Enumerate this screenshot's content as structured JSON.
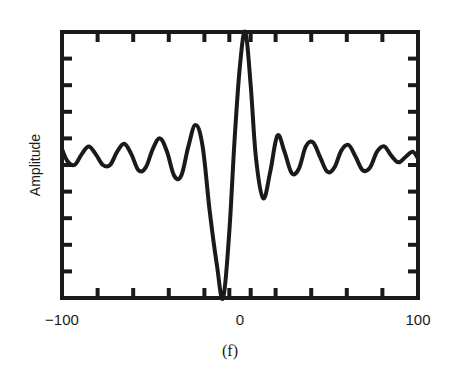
{
  "chart_data": {
    "type": "line",
    "title": "",
    "caption": "(f)",
    "xlabel": "",
    "ylabel": "Amplitude",
    "xlim": [
      -100,
      100
    ],
    "ylim": [
      -1,
      1
    ],
    "x_tick_labels": [
      {
        "value": -100,
        "label": "−100"
      },
      {
        "value": 0,
        "label": "0"
      },
      {
        "value": 100,
        "label": "100"
      }
    ],
    "x_minor_ticks": [
      -80,
      -60,
      -40,
      -20,
      -6,
      6,
      20,
      40,
      60,
      80
    ],
    "y_minor_ticks": [
      -0.8,
      -0.6,
      -0.4,
      -0.2,
      0.0,
      0.2,
      0.4,
      0.6,
      0.8
    ],
    "y_tick_labels": [],
    "grid": false,
    "legend": "none",
    "series": [
      {
        "name": "Amplitude",
        "color": "#1a1a1a",
        "x": [
          -100,
          -97,
          -93,
          -89,
          -85,
          -81,
          -77,
          -73,
          -69,
          -65,
          -61,
          -57,
          -53,
          -49,
          -45,
          -41,
          -37,
          -33,
          -29,
          -25,
          -21,
          -17,
          -13,
          -9.5,
          -6,
          -3,
          0,
          3,
          6,
          9,
          13,
          17,
          21,
          25,
          29,
          33,
          37,
          41,
          45,
          49,
          53,
          57,
          61,
          65,
          69,
          73,
          77,
          81,
          85,
          89,
          93,
          97,
          100
        ],
        "y": [
          0.12,
          0.03,
          0.0,
          0.08,
          0.14,
          0.08,
          0.0,
          0.0,
          0.1,
          0.16,
          0.08,
          -0.04,
          -0.02,
          0.12,
          0.2,
          0.1,
          -0.08,
          -0.08,
          0.14,
          0.3,
          0.14,
          -0.35,
          -0.75,
          -1.0,
          -0.5,
          0.2,
          0.75,
          1.0,
          0.6,
          0.05,
          -0.25,
          -0.05,
          0.22,
          0.1,
          -0.06,
          -0.03,
          0.14,
          0.17,
          0.06,
          -0.05,
          -0.02,
          0.11,
          0.15,
          0.06,
          -0.04,
          -0.02,
          0.1,
          0.14,
          0.07,
          0.02,
          0.06,
          0.1,
          0.05
        ]
      }
    ]
  }
}
